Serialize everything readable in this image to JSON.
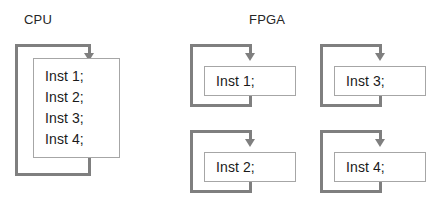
{
  "diagram": {
    "type": "flow-comparison",
    "colors": {
      "loop_line": "#7f7f7f",
      "box_border": "#a6a6a6",
      "box_fill": "#ffffff",
      "text": "#1a1a1a",
      "background": "#ffffff"
    }
  },
  "cpu": {
    "title": "CPU",
    "instructions": [
      "Inst 1;",
      "Inst 2;",
      "Inst 3;",
      "Inst 4;"
    ],
    "loop": {
      "icon": "loop-arrow-icon",
      "arrow_direction": "down"
    }
  },
  "fpga": {
    "title": "FPGA",
    "units": [
      {
        "instruction": "Inst 1;",
        "loop": {
          "icon": "loop-arrow-icon",
          "arrow_direction": "down"
        }
      },
      {
        "instruction": "Inst 2;",
        "loop": {
          "icon": "loop-arrow-icon",
          "arrow_direction": "down"
        }
      },
      {
        "instruction": "Inst 3;",
        "loop": {
          "icon": "loop-arrow-icon",
          "arrow_direction": "down"
        }
      },
      {
        "instruction": "Inst 4;",
        "loop": {
          "icon": "loop-arrow-icon",
          "arrow_direction": "down"
        }
      }
    ]
  }
}
